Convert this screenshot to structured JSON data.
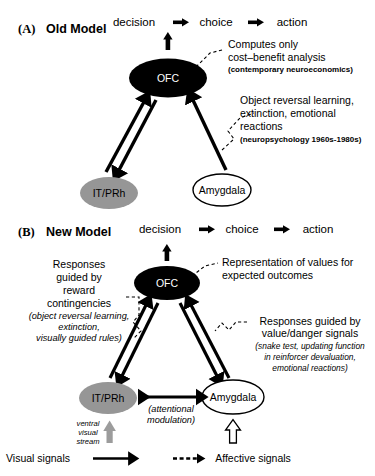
{
  "figure": {
    "colors": {
      "ofc_fill": "#000000",
      "ofc_text": "#ffffff",
      "itprh_fill": "#969696",
      "amygdala_fill": "#ffffff",
      "stroke": "#000000",
      "gray_arrow": "#9c9c9c",
      "background": "#ffffff"
    }
  },
  "panelA": {
    "letter": "(A)",
    "title": "Old Model",
    "flow": {
      "step1": "decision",
      "step2": "choice",
      "step3": "action",
      "arrow_glyph": "thick-right-arrow"
    },
    "nodes": {
      "ofc": "OFC",
      "itprh": "IT/PRh",
      "amygdala": "Amygdala"
    },
    "annotation_ofc": {
      "line1": "Computes only",
      "line2": "cost–benefit analysis",
      "line3": "(contemporary neuroeconomics)"
    },
    "annotation_inputs": {
      "line1": "Object reversal learning,",
      "line2": "extinction, emotional",
      "line3": "reactions",
      "line4": "(neuropsychology 1960s-1980s)"
    }
  },
  "panelB": {
    "letter": "(B)",
    "title": "New Model",
    "flow": {
      "step1": "decision",
      "step2": "choice",
      "step3": "action",
      "arrow_glyph": "thick-right-arrow"
    },
    "nodes": {
      "ofc": "OFC",
      "itprh": "IT/PRh",
      "amygdala": "Amygdala"
    },
    "annotation_left": {
      "line1": "Responses",
      "line2": "guided by",
      "line3": "reward",
      "line4": "contingencies",
      "italic1": "(object reversal learning,",
      "italic2": "extinction,",
      "italic3": "visually guided rules)"
    },
    "annotation_top_right": {
      "line1": "Representation of values for",
      "line2": "expected outcomes"
    },
    "annotation_right": {
      "line1": "Responses guided by",
      "line2": "value/danger signals",
      "italic1": "(snake test, updating function",
      "italic2": "in reinforcer devaluation,",
      "italic3": "emotional reactions)"
    },
    "annotation_middle": {
      "line1": "(attentional",
      "line2": "modulation)"
    },
    "annotation_ventral": {
      "line1": "ventral",
      "line2": "visual",
      "line3": "stream"
    }
  },
  "legend": {
    "visual_label": "Visual signals",
    "affective_label": "Affective signals",
    "visual_glyph": "solid-arrow",
    "affective_glyph": "dashed-arrow"
  }
}
